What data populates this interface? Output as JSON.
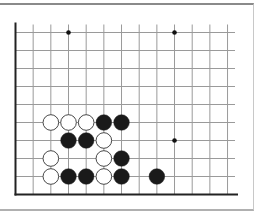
{
  "board": {
    "columns": 13,
    "rows": 10,
    "origin_x": 15.5,
    "origin_y": 32.5,
    "spacing_x": 17.67,
    "spacing_y": 18,
    "right_extend": 235,
    "edges": [
      "left",
      "bottom"
    ],
    "line_color": "#9a9a9a",
    "edge_color": "#222222",
    "star_points": [
      {
        "col": 3,
        "row": 0
      },
      {
        "col": 9,
        "row": 0
      },
      {
        "col": 9,
        "row": 6
      }
    ],
    "stones": [
      {
        "color": "white",
        "col": 2,
        "row": 5
      },
      {
        "color": "white",
        "col": 3,
        "row": 5
      },
      {
        "color": "white",
        "col": 4,
        "row": 5
      },
      {
        "color": "black",
        "col": 5,
        "row": 5
      },
      {
        "color": "black",
        "col": 6,
        "row": 5
      },
      {
        "color": "black",
        "col": 3,
        "row": 6
      },
      {
        "color": "black",
        "col": 4,
        "row": 6
      },
      {
        "color": "white",
        "col": 5,
        "row": 6
      },
      {
        "color": "white",
        "col": 2,
        "row": 7
      },
      {
        "color": "white",
        "col": 5,
        "row": 7
      },
      {
        "color": "black",
        "col": 6,
        "row": 7
      },
      {
        "color": "white",
        "col": 2,
        "row": 8
      },
      {
        "color": "black",
        "col": 3,
        "row": 8
      },
      {
        "color": "black",
        "col": 4,
        "row": 8
      },
      {
        "color": "white",
        "col": 5,
        "row": 8
      },
      {
        "color": "black",
        "col": 6,
        "row": 8
      },
      {
        "color": "black",
        "col": 8,
        "row": 8
      }
    ],
    "colors": {
      "black_stone": "#1a1a1a",
      "white_stone": "#ffffff",
      "white_stone_outline": "#333333",
      "star_point": "#111111"
    }
  }
}
